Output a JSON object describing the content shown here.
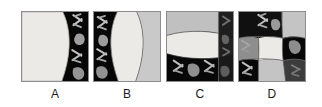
{
  "figure": {
    "type": "multi-panel-micrograph-figure",
    "background_color": "#ffffff",
    "panel_count": 4,
    "panel_border_color": "#8d8d8d",
    "label_color": "#1b1b1b"
  },
  "palette": {
    "black": "#070707",
    "dark": "#1a1a1a",
    "mid_dark": "#3c3c3c",
    "mid_gray": "#8e8e8e",
    "light_gray": "#c9c9c9",
    "pale_gray": "#dedede",
    "near_white": "#eceae6",
    "white": "#f3f2ef",
    "contour_line": "#4a4a4a"
  },
  "panels": [
    {
      "id": "panel-a",
      "label": "A",
      "description": "Micrograph with large pale region on the left and a dark band on the right containing bright chromosome-like objects; a single smooth vertical contour separates the two regions.",
      "regions": [
        {
          "name": "pale-field",
          "fill": "#eceae6",
          "position": "left"
        },
        {
          "name": "dark-field",
          "fill": "#070707",
          "position": "right"
        }
      ],
      "contours": 1,
      "objects": [
        "cross-chromosome-upper",
        "blob-upper",
        "cross-chromosome-lower",
        "blob-lower"
      ]
    },
    {
      "id": "panel-b",
      "label": "B",
      "description": "Dark field on the left with bright chromosome objects, a large white lens-shaped region in the centre, and a light gray field on the right; two curved contours bound the lens.",
      "regions": [
        {
          "name": "dark-field",
          "fill": "#070707",
          "position": "left"
        },
        {
          "name": "lens-region",
          "fill": "#eceae6",
          "position": "center"
        },
        {
          "name": "light-field",
          "fill": "#c9c9c9",
          "position": "right"
        }
      ],
      "contours": 2,
      "objects": [
        "cross-chromosome-upper",
        "blob-upper",
        "cross-chromosome-lower",
        "blob-lower"
      ]
    },
    {
      "id": "panel-c",
      "label": "C",
      "description": "Light gray band across the top, a broad white ellipse across the middle, a black field across the bottom holding bright chromosome objects, and a dark right-hand strip cut by a vertical contour.",
      "regions": [
        {
          "name": "top-light-field",
          "fill": "#c9c9c9",
          "position": "top"
        },
        {
          "name": "ellipse-region",
          "fill": "#eceae6",
          "position": "middle"
        },
        {
          "name": "bottom-dark-field",
          "fill": "#070707",
          "position": "bottom"
        },
        {
          "name": "right-dark-strip",
          "fill": "#1a1a1a",
          "position": "right"
        }
      ],
      "contours": 3,
      "objects": [
        "cross-chromosome-bottom-left",
        "blob-bottom-center",
        "cross-chromosome-bottom-right",
        "faint-chromosome-right"
      ]
    },
    {
      "id": "panel-d",
      "label": "D",
      "description": "Checkerboard-like partition of light and dark cells produced by several curved contours; a pale quadrilateral occupies the centre and chromosome objects sit in the dark cells.",
      "regions": [
        {
          "name": "top-left-dark-cell",
          "fill": "#1a1a1a",
          "position": "top-left"
        },
        {
          "name": "top-right-light-cell",
          "fill": "#c9c9c9",
          "position": "top-right"
        },
        {
          "name": "center-pale-cell",
          "fill": "#eceae6",
          "position": "center"
        },
        {
          "name": "left-mid-light-cell",
          "fill": "#8e8e8e",
          "position": "left"
        },
        {
          "name": "right-mid-dark-cell",
          "fill": "#070707",
          "position": "right"
        },
        {
          "name": "bottom-left-dark-cell",
          "fill": "#070707",
          "position": "bottom-left"
        },
        {
          "name": "bottom-center-light-cell",
          "fill": "#c9c9c9",
          "position": "bottom-center"
        },
        {
          "name": "bottom-right-mid-cell",
          "fill": "#3c3c3c",
          "position": "bottom-right"
        }
      ],
      "contours": 5,
      "objects": [
        "cross-chromosome-top",
        "blob-top-right",
        "chromosome-left",
        "blob-right",
        "cross-chromosome-bottom",
        "faint-chromosome-bottom-right"
      ]
    }
  ]
}
